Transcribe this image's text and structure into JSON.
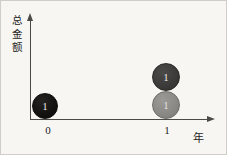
{
  "chart_data": {
    "type": "scatter",
    "title": "",
    "xlabel": "年",
    "ylabel": "总金额",
    "xticklabels": [
      "0",
      "1"
    ],
    "yticklabels": [],
    "grid": false,
    "legend": false,
    "xlim": [
      0,
      1
    ],
    "series": [
      {
        "name": "series-1",
        "color": "#121110",
        "points": [
          {
            "x": 0,
            "y": 1,
            "label": "1",
            "size": 26
          }
        ]
      },
      {
        "name": "series-2",
        "color": "#3b3a38",
        "points": [
          {
            "x": 1,
            "y": 3,
            "label": "1",
            "size": 28
          }
        ]
      },
      {
        "name": "series-3",
        "color": "#8a8884",
        "points": [
          {
            "x": 1,
            "y": 2,
            "label": "1",
            "size": 28
          }
        ]
      }
    ]
  },
  "axes": {
    "y_title": "总金额",
    "x_title": "年",
    "ticks": {
      "x0": "0",
      "x1": "1"
    }
  },
  "bubbles": {
    "year0": {
      "value": "1"
    },
    "year1_upper": {
      "value": "1"
    },
    "year1_lower": {
      "value": "1"
    }
  },
  "colors": {
    "background": "#f7f6f3",
    "axis": "#4c4a47",
    "text": "#1e1c1a",
    "bubble_black": "#121110",
    "bubble_dark_gray": "#3b3a38",
    "bubble_gray": "#8a8884"
  }
}
